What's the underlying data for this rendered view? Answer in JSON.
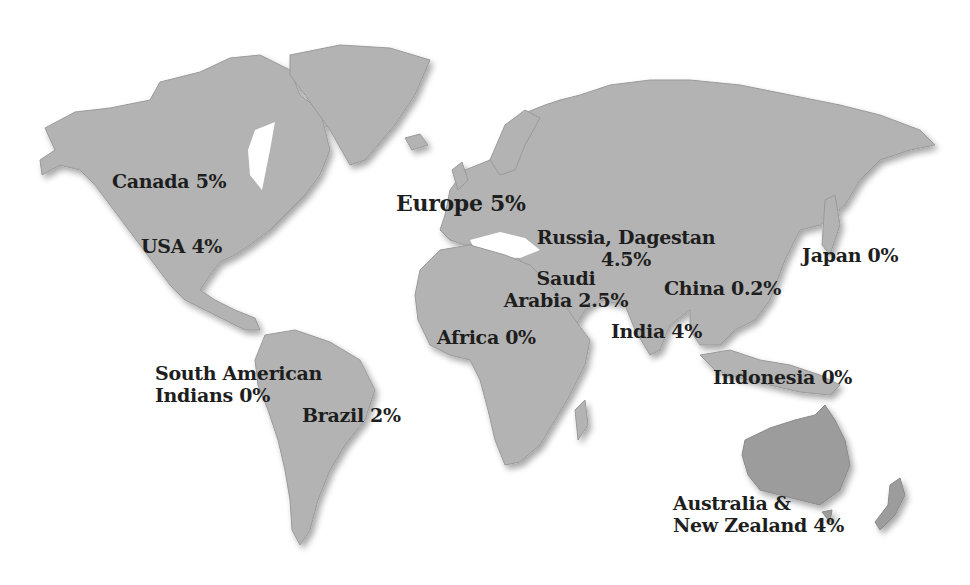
{
  "map": {
    "background": "#ffffff",
    "land_color": "#b3b3b3",
    "text_color": "#1e1e1e",
    "regions": [
      {
        "id": "canada",
        "name": "Canada",
        "value": "5%",
        "lines": [
          "Canada 5%"
        ]
      },
      {
        "id": "usa",
        "name": "USA",
        "value": "4%",
        "lines": [
          "USA 4%"
        ]
      },
      {
        "id": "europe",
        "name": "Europe",
        "value": "5%",
        "lines": [
          "Europe 5%"
        ]
      },
      {
        "id": "russia",
        "name": "Russia, Dagestan",
        "value": "4.5%",
        "lines": [
          "Russia, Dagestan",
          "4.5%"
        ]
      },
      {
        "id": "japan",
        "name": "Japan",
        "value": "0%",
        "lines": [
          "Japan 0%"
        ]
      },
      {
        "id": "saudi",
        "name": "Saudi Arabia",
        "value": "2.5%",
        "lines": [
          "Saudi",
          "Arabia 2.5%"
        ]
      },
      {
        "id": "china",
        "name": "China",
        "value": "0.2%",
        "lines": [
          "China 0.2%"
        ]
      },
      {
        "id": "africa",
        "name": "Africa",
        "value": "0%",
        "lines": [
          "Africa 0%"
        ]
      },
      {
        "id": "india",
        "name": "India",
        "value": "4%",
        "lines": [
          "India 4%"
        ]
      },
      {
        "id": "south-american-indians",
        "name": "South American Indians",
        "value": "0%",
        "lines": [
          "South American",
          "Indians 0%"
        ]
      },
      {
        "id": "brazil",
        "name": "Brazil",
        "value": "2%",
        "lines": [
          "Brazil 2%"
        ]
      },
      {
        "id": "indonesia",
        "name": "Indonesia",
        "value": "0%",
        "lines": [
          "Indonesia 0%"
        ]
      },
      {
        "id": "australia-nz",
        "name": "Australia & New Zealand",
        "value": "4%",
        "lines": [
          "Australia &",
          "New Zealand 4%"
        ]
      }
    ]
  }
}
